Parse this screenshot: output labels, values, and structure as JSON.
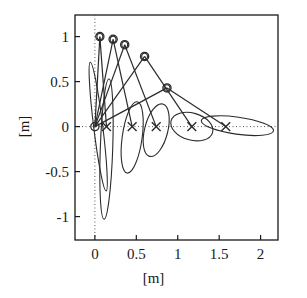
{
  "chart_data": {
    "type": "scatter",
    "title": "",
    "subtitle": "",
    "xlabel": "[m]",
    "ylabel": "[m]",
    "xlim": [
      -0.24,
      2.21
    ],
    "ylim": [
      -1.26,
      1.24
    ],
    "xticks": [
      0,
      0.5,
      1,
      1.5,
      2
    ],
    "xtick_labels": [
      "0",
      "0.5",
      "1",
      "1.5",
      "2"
    ],
    "yticks": [
      1,
      0.5,
      0,
      -0.5,
      -1
    ],
    "ytick_labels": [
      "1",
      "0.5",
      "0",
      "-0.5",
      "-1"
    ],
    "grid": false,
    "zero_lines": true,
    "legend": null,
    "annotations": [],
    "series": [
      {
        "name": "apex-markers",
        "marker": "circle",
        "points": [
          {
            "x": 0.0,
            "y": 0.0
          },
          {
            "x": 0.06,
            "y": 1.0
          },
          {
            "x": 0.22,
            "y": 0.97
          },
          {
            "x": 0.36,
            "y": 0.91
          },
          {
            "x": 0.6,
            "y": 0.78
          },
          {
            "x": 0.87,
            "y": 0.43
          }
        ]
      },
      {
        "name": "contact-markers",
        "marker": "x",
        "points": [
          {
            "x": 0.14,
            "y": 0.0
          },
          {
            "x": 0.45,
            "y": 0.0
          },
          {
            "x": 0.74,
            "y": 0.0
          },
          {
            "x": 1.17,
            "y": 0.0
          },
          {
            "x": 1.58,
            "y": 0.0
          }
        ]
      },
      {
        "name": "trajectory-segments",
        "marker": "line",
        "segments": [
          [
            {
              "x": 0.0,
              "y": 0.0
            },
            {
              "x": 0.06,
              "y": 1.0
            }
          ],
          [
            {
              "x": 0.06,
              "y": 1.0
            },
            {
              "x": 0.14,
              "y": 0.0
            }
          ],
          [
            {
              "x": 0.0,
              "y": 0.0
            },
            {
              "x": 0.22,
              "y": 0.97
            }
          ],
          [
            {
              "x": 0.22,
              "y": 0.97
            },
            {
              "x": 0.45,
              "y": 0.0
            }
          ],
          [
            {
              "x": 0.0,
              "y": 0.0
            },
            {
              "x": 0.36,
              "y": 0.91
            }
          ],
          [
            {
              "x": 0.36,
              "y": 0.91
            },
            {
              "x": 0.74,
              "y": 0.0
            }
          ],
          [
            {
              "x": 0.0,
              "y": 0.0
            },
            {
              "x": 0.6,
              "y": 0.78
            }
          ],
          [
            {
              "x": 0.6,
              "y": 0.78
            },
            {
              "x": 1.17,
              "y": 0.0
            }
          ],
          [
            {
              "x": 0.0,
              "y": 0.0
            },
            {
              "x": 0.87,
              "y": 0.43
            }
          ],
          [
            {
              "x": 0.87,
              "y": 0.43
            },
            {
              "x": 1.58,
              "y": 0.0
            }
          ]
        ]
      },
      {
        "name": "uncertainty-ellipses",
        "marker": "ellipse",
        "ellipses": [
          {
            "cx": 0.04,
            "cy": 0.0,
            "rx": 0.055,
            "ry": 0.72,
            "angle": -7
          },
          {
            "cx": 0.14,
            "cy": -0.25,
            "rx": 0.075,
            "ry": 0.78,
            "angle": 2
          },
          {
            "cx": 0.45,
            "cy": -0.12,
            "rx": 0.12,
            "ry": 0.4,
            "angle": 8
          },
          {
            "cx": 0.74,
            "cy": -0.04,
            "rx": 0.14,
            "ry": 0.3,
            "angle": 14
          },
          {
            "cx": 1.17,
            "cy": 0.0,
            "rx": 0.26,
            "ry": 0.15,
            "angle": 16
          },
          {
            "cx": 1.72,
            "cy": 0.01,
            "rx": 0.44,
            "ry": 0.095,
            "angle": 8
          },
          {
            "cx": 0.06,
            "cy": 1.0,
            "rx": 0.035,
            "ry": 0.035,
            "angle": 0
          },
          {
            "cx": 0.22,
            "cy": 0.97,
            "rx": 0.035,
            "ry": 0.035,
            "angle": 0
          },
          {
            "cx": 0.36,
            "cy": 0.91,
            "rx": 0.035,
            "ry": 0.035,
            "angle": 0
          },
          {
            "cx": 0.6,
            "cy": 0.78,
            "rx": 0.035,
            "ry": 0.035,
            "angle": 0
          },
          {
            "cx": 0.87,
            "cy": 0.43,
            "rx": 0.035,
            "ry": 0.035,
            "angle": 0
          }
        ]
      }
    ],
    "colors": {
      "line": "#2b2b2b",
      "marker": "#2b2b2b",
      "axis": "#1a1a1a",
      "zero_line": "#555555",
      "background": "#ffffff"
    }
  }
}
